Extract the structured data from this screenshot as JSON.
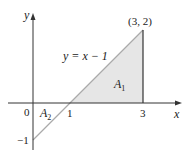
{
  "diagram": {
    "axes": {
      "x_label": "x",
      "y_label": "y",
      "origin_label": "0",
      "tick_labels": {
        "x_1": "1",
        "x_3": "3",
        "y_neg1": "−1"
      }
    },
    "line": {
      "equation": "y = x − 1",
      "label_main": "y = x − 1"
    },
    "point": {
      "label": "(3, 2)"
    },
    "regions": [
      {
        "name": "A",
        "sub": "1",
        "fill": "#e6e6e6"
      },
      {
        "name": "A",
        "sub": "2",
        "fill": "#ffffff"
      }
    ],
    "colors": {
      "axis": "#333333",
      "line": "#aaaaaa",
      "shade": "#e6e6e6"
    }
  }
}
